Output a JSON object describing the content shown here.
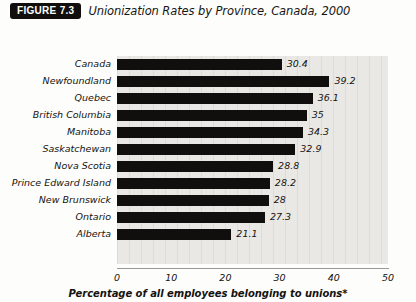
{
  "header": {
    "badge": "FIGURE 7.3",
    "title": "Unionization Rates by Province, Canada, 2000"
  },
  "chart_data": {
    "type": "bar",
    "orientation": "horizontal",
    "title": "Unionization Rates by Province, Canada, 2000",
    "categories": [
      "Canada",
      "Newfoundland",
      "Quebec",
      "British Columbia",
      "Manitoba",
      "Saskatchewan",
      "Nova Scotia",
      "Prince Edward Island",
      "New Brunswick",
      "Ontario",
      "Alberta"
    ],
    "values": [
      30.4,
      39.2,
      36.1,
      35,
      34.3,
      32.9,
      28.8,
      28.2,
      28,
      27.3,
      21.1
    ],
    "value_labels": [
      "30.4",
      "39.2",
      "36.1",
      "35",
      "34.3",
      "32.9",
      "28.8",
      "28.2",
      "28",
      "27.3",
      "21.1"
    ],
    "xlabel": "Percentage of all employees belonging to unions*",
    "ylabel": "",
    "xlim": [
      0,
      50
    ],
    "xticks": [
      0,
      10,
      20,
      30,
      40,
      50
    ],
    "xtick_labels": [
      "0",
      "10",
      "20",
      "30",
      "40",
      "50"
    ],
    "grid": true,
    "legend": null,
    "bar_color": "#100f0d",
    "plot_background": "#e9e8e4"
  }
}
